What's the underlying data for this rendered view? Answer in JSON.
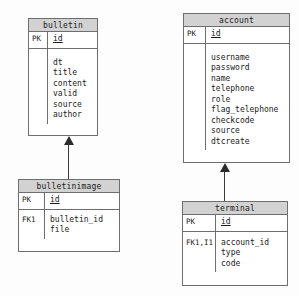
{
  "diagram": {
    "type": "entity-relationship-diagram",
    "background_color": "#fdfdfd",
    "header_fill": "#d2d2d2",
    "border_color": "#6e6e6e",
    "entities": [
      {
        "name": "bulletin",
        "key_label": "PK",
        "key_field": "id",
        "fk_label": "",
        "attributes": "dt\ntitle\ncontent\nvalid\nsource\nauthor"
      },
      {
        "name": "account",
        "key_label": "PK",
        "key_field": "id",
        "fk_label": "",
        "attributes": "username\npassword\nname\ntelephone\nrole\nflag_telephone\ncheckcode\nsource\ndtcreate"
      },
      {
        "name": "bulletinimage",
        "key_label": "PK",
        "key_field": "id",
        "fk_label": "FK1",
        "attributes": "bulletin_id\nfile"
      },
      {
        "name": "terminal",
        "key_label": "PK",
        "key_field": "id",
        "fk_label": "FK1,I1",
        "attributes": "account_id\ntype\ncode"
      }
    ],
    "relationships": [
      {
        "from": "bulletinimage",
        "to": "bulletin",
        "arrow": "identifying-up"
      },
      {
        "from": "terminal",
        "to": "account",
        "arrow": "identifying-up"
      }
    ]
  }
}
